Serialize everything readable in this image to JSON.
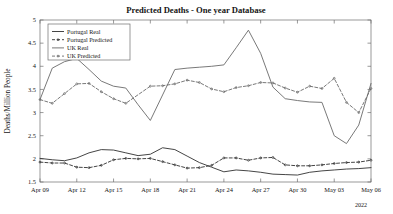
{
  "chart_data": {
    "type": "line",
    "title": "Predicted Deaths - One year Database",
    "xlabel": "",
    "ylabel": "Deaths/Million People",
    "ylim": [
      1.5,
      5
    ],
    "yticks": [
      "1.5",
      "2",
      "2.5",
      "3",
      "3.5",
      "4",
      "4.5",
      "5"
    ],
    "ytick_values": [
      1.5,
      2,
      2.5,
      3,
      3.5,
      4,
      4.5,
      5
    ],
    "xticks": [
      "Apr 09",
      "Apr 12",
      "Apr 15",
      "Apr 18",
      "Apr 21",
      "Apr 24",
      "Apr 27",
      "Apr 30",
      "May 03",
      "May 06"
    ],
    "xtick_values": [
      0,
      3,
      6,
      9,
      12,
      15,
      18,
      21,
      24,
      27
    ],
    "xlim": [
      0,
      27
    ],
    "year_annotation": "2022",
    "grid": false,
    "legend_position": "upper-left",
    "legend": [
      "Portugal Real",
      "Portugal Predicted",
      "UK Real",
      "UK Predicted"
    ],
    "series": [
      {
        "name": "Portugal Real",
        "style": "solid",
        "color": "#303030",
        "x": [
          0,
          1,
          2,
          3,
          4,
          5,
          6,
          7,
          8,
          9,
          10,
          11,
          12,
          13,
          14,
          15,
          16,
          17,
          18,
          19,
          20,
          21,
          22,
          23,
          24,
          25,
          26,
          27
        ],
        "values": [
          2.01,
          1.98,
          1.96,
          2.02,
          2.13,
          2.2,
          2.19,
          2.13,
          2.07,
          2.1,
          2.24,
          2.2,
          2.06,
          1.92,
          1.82,
          1.72,
          1.76,
          1.74,
          1.71,
          1.67,
          1.66,
          1.65,
          1.71,
          1.74,
          1.76,
          1.78,
          1.79,
          1.81
        ]
      },
      {
        "name": "Portugal Predicted",
        "style": "dashed",
        "color": "#303030",
        "x": [
          0,
          1,
          2,
          3,
          4,
          5,
          6,
          7,
          8,
          9,
          10,
          11,
          12,
          13,
          14,
          15,
          16,
          17,
          18,
          19,
          20,
          21,
          22,
          23,
          24,
          25,
          26,
          27
        ],
        "values": [
          1.93,
          1.91,
          1.91,
          1.82,
          1.81,
          1.86,
          1.98,
          2.01,
          2.0,
          2.01,
          1.94,
          1.87,
          1.8,
          1.81,
          1.86,
          2.02,
          2.02,
          1.97,
          2.02,
          2.03,
          1.87,
          1.85,
          1.85,
          1.87,
          1.9,
          1.92,
          1.93,
          1.97
        ]
      },
      {
        "name": "UK Real",
        "style": "solid",
        "color": "#6a6a6a",
        "x": [
          0,
          1,
          2,
          3,
          4,
          5,
          6,
          7,
          8,
          9,
          10,
          11,
          12,
          13,
          14,
          15,
          16,
          17,
          18,
          19,
          20,
          21,
          22,
          23,
          24,
          25,
          26,
          27
        ],
        "values": [
          3.28,
          3.96,
          4.1,
          4.17,
          3.93,
          3.68,
          3.57,
          3.53,
          3.17,
          2.83,
          3.38,
          3.93,
          3.96,
          3.98,
          4.0,
          4.03,
          4.4,
          4.78,
          4.28,
          3.55,
          3.3,
          3.26,
          3.23,
          3.22,
          2.5,
          2.33,
          2.73,
          3.63
        ]
      },
      {
        "name": "UK Predicted",
        "style": "dashed",
        "color": "#6a6a6a",
        "x": [
          0,
          1,
          2,
          3,
          4,
          5,
          6,
          7,
          9,
          10,
          11,
          12,
          13,
          14,
          15,
          16,
          17,
          18,
          19,
          20,
          21,
          22,
          23,
          24,
          25,
          26,
          27
        ],
        "values": [
          3.28,
          3.2,
          3.41,
          3.62,
          3.63,
          3.45,
          3.3,
          3.2,
          3.57,
          3.58,
          3.62,
          3.7,
          3.65,
          3.51,
          3.45,
          3.54,
          3.58,
          3.65,
          3.64,
          3.53,
          3.44,
          3.57,
          3.52,
          3.74,
          3.22,
          3.0,
          3.52
        ]
      }
    ]
  },
  "figure": {
    "background_color": "#ffffff",
    "axis_color": "#6e6e6e"
  }
}
